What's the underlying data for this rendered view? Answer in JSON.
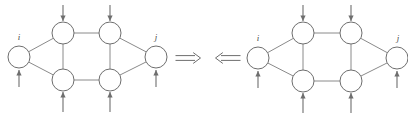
{
  "figure": {
    "canvas": {
      "width": 408,
      "height": 117,
      "background": "#ffffff"
    },
    "colors": {
      "node_stroke": "#6e6e6e",
      "node_fill": "#ffffff",
      "edge_stroke": "#8a8a8a",
      "arrow_stroke": "#6e6e6e",
      "label_color": "#4a4a4a"
    },
    "relation_symbols": [
      {
        "name": "implies-right",
        "glyph": "⟹",
        "x": 188,
        "y": 58
      },
      {
        "name": "implies-left",
        "glyph": "⟸",
        "x": 228,
        "y": 58
      }
    ],
    "graphs": [
      {
        "id": "left-graph",
        "name": "source-graph",
        "nodes": [
          {
            "id": "L-i",
            "label": "i",
            "cx": 19,
            "cy": 57,
            "r": 11,
            "label_x": 19,
            "label_y": 40
          },
          {
            "id": "L-tl",
            "label": "",
            "cx": 63,
            "cy": 33,
            "r": 11,
            "label_x": 0,
            "label_y": 0
          },
          {
            "id": "L-tr",
            "label": "",
            "cx": 110,
            "cy": 33,
            "r": 11,
            "label_x": 0,
            "label_y": 0
          },
          {
            "id": "L-bl",
            "label": "",
            "cx": 63,
            "cy": 80,
            "r": 11,
            "label_x": 0,
            "label_y": 0
          },
          {
            "id": "L-br",
            "label": "",
            "cx": 110,
            "cy": 80,
            "r": 11,
            "label_x": 0,
            "label_y": 0
          },
          {
            "id": "L-j",
            "label": "j",
            "cx": 156,
            "cy": 57,
            "r": 11,
            "label_x": 156,
            "label_y": 40
          }
        ],
        "edges": [
          {
            "from": "L-i",
            "to": "L-tl"
          },
          {
            "from": "L-i",
            "to": "L-bl"
          },
          {
            "from": "L-tl",
            "to": "L-tr"
          },
          {
            "from": "L-tl",
            "to": "L-bl"
          },
          {
            "from": "L-bl",
            "to": "L-br"
          },
          {
            "from": "L-tr",
            "to": "L-br"
          },
          {
            "from": "L-tr",
            "to": "L-j"
          },
          {
            "from": "L-br",
            "to": "L-j"
          }
        ],
        "flow_arrows": [
          {
            "name": "inflow-top-left",
            "direction": "down",
            "x": 63,
            "y1": 5,
            "y2": 21
          },
          {
            "name": "inflow-top-right",
            "direction": "down",
            "x": 110,
            "y1": 5,
            "y2": 21
          },
          {
            "name": "inflow-bottom-left",
            "direction": "up",
            "x": 63,
            "y1": 112,
            "y2": 92
          },
          {
            "name": "inflow-bottom-right",
            "direction": "up",
            "x": 110,
            "y1": 112,
            "y2": 92
          },
          {
            "name": "inflow-node-i",
            "direction": "up",
            "x": 19,
            "y1": 87,
            "y2": 70
          },
          {
            "name": "inflow-node-j",
            "direction": "up",
            "x": 156,
            "y1": 87,
            "y2": 70
          }
        ]
      },
      {
        "id": "right-graph",
        "name": "result-graph",
        "nodes": [
          {
            "id": "R-i",
            "label": "i",
            "cx": 258,
            "cy": 58,
            "r": 11,
            "label_x": 258,
            "label_y": 41
          },
          {
            "id": "R-tl",
            "label": "",
            "cx": 303,
            "cy": 33,
            "r": 11,
            "label_x": 0,
            "label_y": 0
          },
          {
            "id": "R-tr",
            "label": "",
            "cx": 351,
            "cy": 33,
            "r": 11,
            "label_x": 0,
            "label_y": 0
          },
          {
            "id": "R-bl",
            "label": "",
            "cx": 303,
            "cy": 81,
            "r": 11,
            "label_x": 0,
            "label_y": 0
          },
          {
            "id": "R-br",
            "label": "",
            "cx": 351,
            "cy": 81,
            "r": 11,
            "label_x": 0,
            "label_y": 0
          },
          {
            "id": "R-j",
            "label": "j",
            "cx": 397,
            "cy": 58,
            "r": 11,
            "label_x": 398,
            "label_y": 41
          }
        ],
        "edges": [
          {
            "from": "R-i",
            "to": "R-tl"
          },
          {
            "from": "R-i",
            "to": "R-bl"
          },
          {
            "from": "R-tl",
            "to": "R-tr"
          },
          {
            "from": "R-tl",
            "to": "R-bl"
          },
          {
            "from": "R-bl",
            "to": "R-br"
          },
          {
            "from": "R-tr",
            "to": "R-br"
          },
          {
            "from": "R-tr",
            "to": "R-j"
          },
          {
            "from": "R-br",
            "to": "R-j"
          }
        ],
        "flow_arrows": [
          {
            "name": "inflow-top-left",
            "direction": "down",
            "x": 303,
            "y1": 5,
            "y2": 21
          },
          {
            "name": "inflow-top-right",
            "direction": "down",
            "x": 351,
            "y1": 5,
            "y2": 21
          },
          {
            "name": "inflow-bottom-left",
            "direction": "up",
            "x": 303,
            "y1": 113,
            "y2": 93
          },
          {
            "name": "inflow-bottom-right",
            "direction": "up",
            "x": 351,
            "y1": 113,
            "y2": 93
          },
          {
            "name": "inflow-node-i",
            "direction": "up",
            "x": 258,
            "y1": 88,
            "y2": 71
          },
          {
            "name": "inflow-node-j",
            "direction": "up",
            "x": 397,
            "y1": 88,
            "y2": 71
          }
        ]
      }
    ]
  }
}
